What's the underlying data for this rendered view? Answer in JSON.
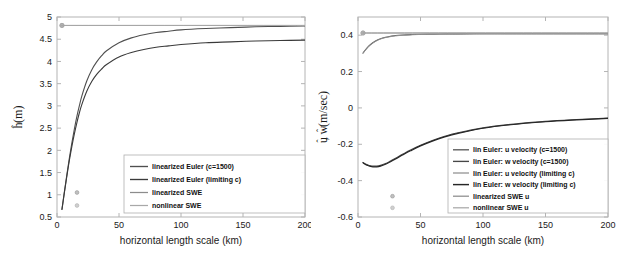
{
  "figure": {
    "title": "",
    "panels": [
      "left",
      "right"
    ]
  },
  "chart_data": [
    {
      "type": "line",
      "panel": "left",
      "title": "",
      "xlabel": "horizontal length scale (km)",
      "ylabel": "ĥ (m)",
      "ylabel_parts": {
        "symbol": "h",
        "accent": "hat",
        "units": "(m)"
      },
      "xlim": [
        0,
        200
      ],
      "ylim": [
        0.5,
        5
      ],
      "xticks": [
        0,
        50,
        100,
        150,
        200
      ],
      "yticks": [
        0.5,
        1,
        1.5,
        2,
        2.5,
        3,
        3.5,
        4,
        4.5,
        5
      ],
      "xticklabels": [
        "0",
        "50",
        "100",
        "150",
        "200"
      ],
      "yticklabels": [
        "0.5",
        "1",
        "1.5",
        "2",
        "2.5",
        "3",
        "3.5",
        "4",
        "4.5",
        "5"
      ],
      "grid": false,
      "legend_position": "lower right",
      "series": [
        {
          "name": "linearized Euler (c=1500)",
          "color": "#4f4f4f",
          "width": 1.1,
          "marker": "none",
          "x": [
            4,
            6,
            8,
            10,
            12,
            14,
            16,
            18,
            20,
            24,
            28,
            32,
            36,
            40,
            50,
            60,
            70,
            80,
            90,
            100,
            120,
            140,
            160,
            180,
            200
          ],
          "y": [
            0.67,
            1.07,
            1.46,
            1.83,
            2.17,
            2.48,
            2.76,
            3.0,
            3.22,
            3.56,
            3.81,
            3.99,
            4.13,
            4.24,
            4.42,
            4.53,
            4.6,
            4.65,
            4.68,
            4.71,
            4.74,
            4.76,
            4.78,
            4.79,
            4.8
          ]
        },
        {
          "name": "linearized Euler (limiting c)",
          "color": "#3a3a3a",
          "width": 1.1,
          "marker": "none",
          "x": [
            4,
            6,
            8,
            10,
            12,
            14,
            16,
            18,
            20,
            24,
            28,
            32,
            36,
            40,
            50,
            60,
            70,
            80,
            90,
            100,
            120,
            140,
            160,
            180,
            200
          ],
          "y": [
            0.67,
            1.06,
            1.43,
            1.78,
            2.09,
            2.37,
            2.62,
            2.84,
            3.03,
            3.33,
            3.55,
            3.71,
            3.83,
            3.93,
            4.1,
            4.2,
            4.27,
            4.32,
            4.35,
            4.38,
            4.42,
            4.44,
            4.46,
            4.47,
            4.48
          ]
        },
        {
          "name": "linearized SWE",
          "color": "#8c8c8c",
          "width": 1.0,
          "marker": "circle",
          "x": [
            4,
            200
          ],
          "y": [
            4.81,
            4.81
          ]
        },
        {
          "name": "nonlinear SWE",
          "color": "#a8a8a8",
          "width": 1.0,
          "marker": "circle",
          "x": [
            4,
            200
          ],
          "y": [
            4.81,
            4.81
          ]
        }
      ]
    },
    {
      "type": "line",
      "panel": "right",
      "title": "",
      "xlabel": "horizontal length scale (km)",
      "ylabel": "û, ŵ (m/sec)",
      "ylabel_parts": {
        "symbol": "u, w",
        "accent": "hat",
        "units": "(m/sec)"
      },
      "xlim": [
        0,
        200
      ],
      "ylim": [
        -0.6,
        0.5
      ],
      "xticks": [
        0,
        50,
        100,
        150,
        200
      ],
      "yticks": [
        -0.6,
        -0.4,
        -0.2,
        0,
        0.2,
        0.4
      ],
      "xticklabels": [
        "0",
        "50",
        "100",
        "150",
        "200"
      ],
      "yticklabels": [
        "-0.6",
        "-0.4",
        "-0.2",
        "0",
        "0.2",
        "0.4"
      ],
      "grid": false,
      "legend_position": "lower right",
      "series": [
        {
          "name": "lin Euler: u velocity (c=1500)",
          "color": "#5a5a5a",
          "width": 1.1,
          "marker": "none",
          "x": [
            4,
            6,
            8,
            10,
            14,
            18,
            22,
            26,
            30,
            36,
            42,
            50,
            60,
            70,
            80,
            100,
            120,
            150,
            175,
            200
          ],
          "y": [
            0.302,
            0.32,
            0.336,
            0.349,
            0.368,
            0.381,
            0.389,
            0.394,
            0.398,
            0.401,
            0.403,
            0.405,
            0.406,
            0.407,
            0.407,
            0.408,
            0.408,
            0.408,
            0.408,
            0.408
          ]
        },
        {
          "name": "lin Euler: w velocity (c=1500)",
          "color": "#474747",
          "width": 1.1,
          "marker": "none",
          "x": [
            4,
            6,
            8,
            10,
            12,
            15,
            18,
            22,
            26,
            30,
            36,
            42,
            50,
            60,
            70,
            80,
            100,
            120,
            150,
            175,
            200
          ],
          "y": [
            -0.3,
            -0.308,
            -0.314,
            -0.318,
            -0.32,
            -0.32,
            -0.316,
            -0.306,
            -0.292,
            -0.277,
            -0.254,
            -0.232,
            -0.206,
            -0.178,
            -0.155,
            -0.137,
            -0.11,
            -0.092,
            -0.074,
            -0.064,
            -0.056
          ]
        },
        {
          "name": "lin Euler: u velocity (limiting c)",
          "color": "#8f8f8f",
          "width": 1.0,
          "marker": "none",
          "x": [
            4,
            6,
            8,
            10,
            14,
            18,
            22,
            26,
            30,
            36,
            42,
            50,
            60,
            70,
            80,
            100,
            120,
            150,
            175,
            200
          ],
          "y": [
            0.3,
            0.318,
            0.334,
            0.347,
            0.366,
            0.379,
            0.387,
            0.392,
            0.396,
            0.4,
            0.402,
            0.404,
            0.405,
            0.406,
            0.406,
            0.407,
            0.407,
            0.407,
            0.407,
            0.407
          ]
        },
        {
          "name": "lin Euler: w velocity (limiting c)",
          "color": "#262626",
          "width": 1.2,
          "marker": "none",
          "x": [
            4,
            6,
            8,
            10,
            12,
            15,
            18,
            22,
            26,
            30,
            36,
            42,
            50,
            60,
            70,
            80,
            100,
            120,
            150,
            175,
            200
          ],
          "y": [
            -0.302,
            -0.311,
            -0.317,
            -0.322,
            -0.324,
            -0.324,
            -0.32,
            -0.31,
            -0.296,
            -0.281,
            -0.258,
            -0.236,
            -0.209,
            -0.181,
            -0.158,
            -0.14,
            -0.112,
            -0.094,
            -0.076,
            -0.066,
            -0.058
          ]
        },
        {
          "name": "linearized SWE u",
          "color": "#8c8c8c",
          "width": 1.0,
          "marker": "circle",
          "x": [
            4,
            200
          ],
          "y": [
            0.412,
            0.412
          ]
        },
        {
          "name": "nonlinear SWE u",
          "color": "#a8a8a8",
          "width": 1.0,
          "marker": "circle",
          "x": [
            4,
            200
          ],
          "y": [
            0.412,
            0.412
          ]
        }
      ]
    }
  ]
}
